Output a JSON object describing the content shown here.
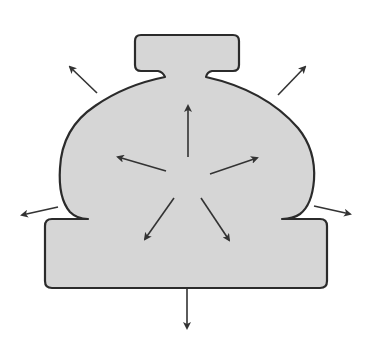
{
  "diagram": {
    "title": "Outward pressure on container shape",
    "colors": {
      "fill": "#d6d6d6",
      "stroke": "#2b2b2b",
      "arrow": "#333333",
      "background": "#ffffff"
    },
    "shape": {
      "description": "Bulbous vessel with a rectangular cap on top and a wide rectangular base",
      "cap": {
        "x": 135,
        "y": 35,
        "width": 104,
        "height": 36
      },
      "base": {
        "x": 45,
        "y": 219,
        "width": 282,
        "height": 69
      }
    },
    "center": {
      "x": 187,
      "y": 175
    },
    "inner_arrows": [
      {
        "name": "up",
        "from": [
          188,
          157
        ],
        "to": [
          188,
          104
        ]
      },
      {
        "name": "up-left",
        "from": [
          166,
          171
        ],
        "to": [
          116,
          156
        ]
      },
      {
        "name": "up-right",
        "from": [
          210,
          174
        ],
        "to": [
          259,
          157
        ]
      },
      {
        "name": "down-left",
        "from": [
          174,
          198
        ],
        "to": [
          144,
          241
        ]
      },
      {
        "name": "down-right",
        "from": [
          201,
          198
        ],
        "to": [
          230,
          242
        ]
      }
    ],
    "outer_arrows": [
      {
        "name": "top-left",
        "from": [
          97,
          93
        ],
        "to": [
          68,
          65
        ]
      },
      {
        "name": "top-right",
        "from": [
          278,
          95
        ],
        "to": [
          307,
          65
        ]
      },
      {
        "name": "left",
        "from": [
          58,
          207
        ],
        "to": [
          20,
          216
        ]
      },
      {
        "name": "right",
        "from": [
          314,
          206
        ],
        "to": [
          352,
          214
        ]
      },
      {
        "name": "bottom",
        "from": [
          187,
          289
        ],
        "to": [
          187,
          330
        ]
      }
    ]
  }
}
